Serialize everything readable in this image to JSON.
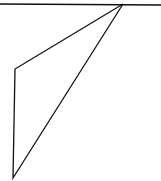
{
  "canvas": {
    "width": 161,
    "height": 181,
    "background": "#ffffff",
    "stroke_color": "#111111",
    "stroke_width": 1.3
  },
  "horizontal_line": {
    "x1": 0,
    "y1": 4,
    "x2": 161,
    "y2": 5
  },
  "triangle": {
    "points": [
      {
        "x": 123,
        "y": 4
      },
      {
        "x": 15,
        "y": 69
      },
      {
        "x": 13,
        "y": 178
      }
    ]
  }
}
